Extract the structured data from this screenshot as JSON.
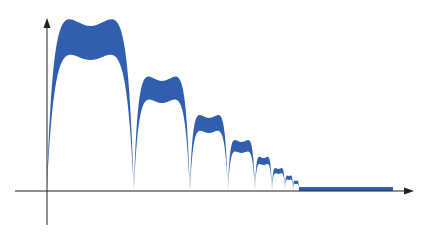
{
  "diagram": {
    "title": "",
    "fill_color": "#2f5fae",
    "axis_color": "#222222",
    "axes": {
      "origin": [
        47,
        191
      ],
      "x_axis": {
        "from": 15,
        "to": 414,
        "y": 191,
        "arrow": true,
        "label": ""
      },
      "y_axis": {
        "from": 225,
        "to": 18,
        "x": 47,
        "arrow": true,
        "label": ""
      }
    },
    "arcs": [
      {
        "x0": 47,
        "x1": 134,
        "outer_peak": 26,
        "inner_peak": 60
      },
      {
        "x0": 134,
        "x1": 190,
        "outer_peak": 81,
        "inner_peak": 103
      },
      {
        "x0": 190,
        "x1": 228,
        "outer_peak": 118,
        "inner_peak": 133
      },
      {
        "x0": 228,
        "x1": 255,
        "outer_peak": 142,
        "inner_peak": 153
      },
      {
        "x0": 255,
        "x1": 272,
        "outer_peak": 158,
        "inner_peak": 165
      },
      {
        "x0": 272,
        "x1": 285,
        "outer_peak": 169,
        "inner_peak": 174
      },
      {
        "x0": 285,
        "x1": 293,
        "outer_peak": 176,
        "inner_peak": 180
      },
      {
        "x0": 293,
        "x1": 299,
        "outer_peak": 181,
        "inner_peak": 184
      }
    ],
    "flat_band": {
      "x0": 299,
      "x1": 393,
      "top": 187,
      "bottom": 191
    }
  }
}
